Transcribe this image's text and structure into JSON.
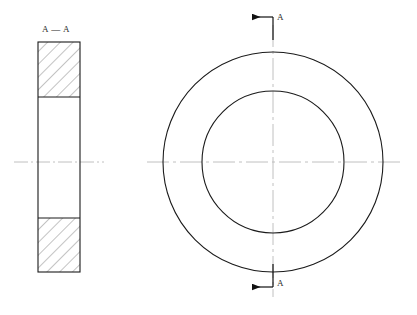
{
  "drawing": {
    "type": "engineering-drawing",
    "description": "Mechanical part drawing: annular washer / ring with full section view",
    "background_color": "#ffffff",
    "canvas": {
      "width": 417,
      "height": 315
    }
  },
  "colors": {
    "outline": "#1a1a1a",
    "hatch": "#7a7a7a",
    "centerline": "#b9b9b9",
    "text": "#2b2b2b",
    "arrow": "#111111"
  },
  "section_view": {
    "title": "A — A",
    "title_position": {
      "x": 42,
      "y": 24
    },
    "outline": {
      "x": 38,
      "y": 42,
      "width": 42,
      "height": 230
    },
    "hatch_regions": [
      {
        "name": "upper-wall-section",
        "x": 38,
        "y": 42,
        "width": 42,
        "height": 55
      },
      {
        "name": "lower-wall-section",
        "x": 38,
        "y": 218,
        "width": 42,
        "height": 54
      }
    ],
    "centerline": {
      "x1": 14,
      "y1": 162,
      "x2": 104,
      "y2": 162
    },
    "hatch_angle_degrees": 45,
    "hatch_spacing": 9
  },
  "front_view": {
    "center": {
      "cx": 273,
      "cy": 162
    },
    "outer_circle": {
      "name": "outer-diameter",
      "r": 110
    },
    "inner_circle": {
      "name": "inner-bore",
      "r": 71
    },
    "horizontal_centerline": {
      "x1": 147,
      "y1": 162,
      "x2": 400,
      "y2": 162
    },
    "vertical_centerline": {
      "x1": 273,
      "y1": 25,
      "x2": 273,
      "y2": 297
    }
  },
  "section_markers": [
    {
      "id": "section-marker-top",
      "letter": "A",
      "letter_position": {
        "x": 277,
        "y": 12
      },
      "arrow_line": {
        "x1": 273,
        "y1": 17,
        "x2": 249,
        "y2": 17
      },
      "direction": "left",
      "cut_line": {
        "x1": 273,
        "y1": 17,
        "x2": 273,
        "y2": 40
      }
    },
    {
      "id": "section-marker-bottom",
      "letter": "A",
      "letter_position": {
        "x": 277,
        "y": 278
      },
      "arrow_line": {
        "x1": 273,
        "y1": 287,
        "x2": 249,
        "y2": 287
      },
      "direction": "left",
      "cut_line": {
        "x1": 273,
        "y1": 264,
        "x2": 273,
        "y2": 287
      }
    }
  ],
  "labels": {
    "section_title": "A — A",
    "marker_top_letter": "A",
    "marker_bottom_letter": "A"
  }
}
